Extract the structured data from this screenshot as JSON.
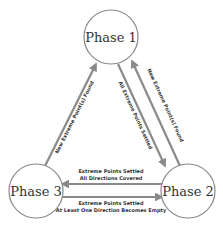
{
  "diagram": {
    "nodes": [
      {
        "id": "phase1",
        "label": "Phase 1"
      },
      {
        "id": "phase2",
        "label": "Phase 2"
      },
      {
        "id": "phase3",
        "label": "Phase 3"
      }
    ],
    "edges": [
      {
        "from": "phase3",
        "to": "phase1",
        "label": "New Extreme Point(s) Found"
      },
      {
        "from": "phase1",
        "to": "phase2",
        "label": "All Extreme Points Settled"
      },
      {
        "from": "phase2",
        "to": "phase1",
        "label": "New Extreme Point(s) Found"
      },
      {
        "from": "phase2",
        "to": "phase3",
        "label_line1": "Extreme Points Settled",
        "label_line2": "All Directions Covered"
      },
      {
        "from": "phase3",
        "to": "phase2",
        "label_line1": "Extreme Points Settled",
        "label_line2": "At Least One Direction Becomes Empty"
      }
    ],
    "colors": {
      "stroke": "#8a8a8a",
      "text": "#333333",
      "background": "#ffffff"
    }
  }
}
